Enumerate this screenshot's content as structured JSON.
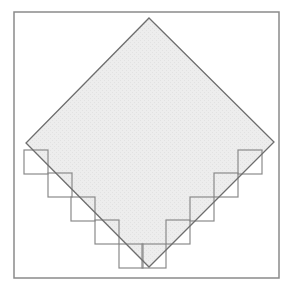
{
  "figure": {
    "frame": {
      "x": 14,
      "y": 12,
      "width": 265,
      "height": 266,
      "stroke": "#8a8a8a"
    },
    "diamond": {
      "points": [
        [
          149,
          18
        ],
        [
          274,
          142
        ],
        [
          149,
          267
        ],
        [
          26,
          143
        ]
      ],
      "fill": "#ececec",
      "stroke": "#6e6e6e"
    },
    "staircase": {
      "stroke": "#8a8a8a",
      "square_size": 24,
      "left_squares": [
        {
          "x": 24,
          "y": 150
        },
        {
          "x": 48,
          "y": 173
        },
        {
          "x": 71,
          "y": 197
        },
        {
          "x": 95,
          "y": 220
        },
        {
          "x": 119,
          "y": 244
        }
      ],
      "right_squares": [
        {
          "x": 142,
          "y": 244
        },
        {
          "x": 166,
          "y": 220
        },
        {
          "x": 190,
          "y": 197
        },
        {
          "x": 214,
          "y": 173
        },
        {
          "x": 238,
          "y": 150
        }
      ]
    }
  }
}
